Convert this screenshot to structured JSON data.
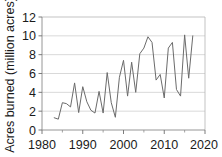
{
  "chart_data": {
    "type": "line",
    "title": "",
    "xlabel": "",
    "ylabel": "Acres burned (million acres)",
    "xlim": [
      1980,
      2020
    ],
    "ylim": [
      0,
      12
    ],
    "xticks": [
      1980,
      1990,
      2000,
      2010,
      2020
    ],
    "xtick_labels": [
      "1980",
      "1990",
      "2000",
      "2010",
      "2020"
    ],
    "xticks_minor": [
      1985,
      1995,
      2005,
      2015
    ],
    "yticks": [
      0,
      2,
      4,
      6,
      8,
      10,
      12
    ],
    "ytick_labels": [
      "0",
      "2",
      "4",
      "6",
      "8",
      "10",
      "12"
    ],
    "grid": "horizontal",
    "legend": "none",
    "series_name": "Acres burned",
    "series_color": "#6b6b6b",
    "x": [
      1983,
      1984,
      1985,
      1986,
      1987,
      1988,
      1989,
      1990,
      1991,
      1992,
      1993,
      1994,
      1995,
      1996,
      1997,
      1998,
      1999,
      2000,
      2001,
      2002,
      2003,
      2004,
      2005,
      2006,
      2007,
      2008,
      2009,
      2010,
      2011,
      2012,
      2013,
      2014,
      2015,
      2016,
      2017
    ],
    "values": [
      1.3,
      1.15,
      2.9,
      2.8,
      2.45,
      5.0,
      1.85,
      4.6,
      3.0,
      2.1,
      1.8,
      4.1,
      1.8,
      6.1,
      2.9,
      1.35,
      5.6,
      7.4,
      3.6,
      7.2,
      4.0,
      8.1,
      8.7,
      9.9,
      9.3,
      5.3,
      5.9,
      3.4,
      8.7,
      9.3,
      4.3,
      3.6,
      10.1,
      5.5,
      10.0
    ],
    "units": "million acres"
  },
  "top_strip": {
    "truncated_text": ""
  }
}
